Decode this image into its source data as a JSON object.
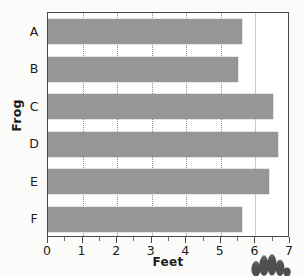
{
  "chart_data": {
    "type": "bar",
    "orientation": "horizontal",
    "title": "",
    "xlabel": "Feet",
    "ylabel": "Frog",
    "categories": [
      "A",
      "B",
      "C",
      "D",
      "E",
      "F"
    ],
    "values": [
      5.6,
      5.5,
      6.5,
      6.65,
      6.4,
      5.6
    ],
    "series": [
      {
        "name": "Distance jumped",
        "values": [
          5.6,
          5.5,
          6.5,
          6.65,
          6.4,
          5.6
        ]
      }
    ],
    "xlim": [
      0,
      7
    ],
    "xticks": [
      0,
      1,
      2,
      3,
      4,
      5,
      6,
      7
    ],
    "xtick_labels": [
      "0",
      "1",
      "2",
      "3",
      "4",
      "5",
      "6",
      "7"
    ],
    "x_minor_ticks": [
      0.5,
      1.5,
      2.5,
      3.5,
      4.5,
      5.5,
      6.5
    ],
    "gridlines": {
      "vertical": [
        1,
        2,
        3,
        4,
        5,
        6
      ],
      "style": "dotted",
      "horizontal": []
    },
    "legend": null,
    "legend_position": "none",
    "bar_color": "#969696",
    "plot_background": "#ffffff",
    "axis_color": "#4a4a4a",
    "gridline_color": "#8d8d8d",
    "text_color": "#1b1b1b"
  },
  "decoration": {
    "frog_foot_name": "frog-foot-illustration",
    "frog_foot_color": "#4f4f4f"
  }
}
